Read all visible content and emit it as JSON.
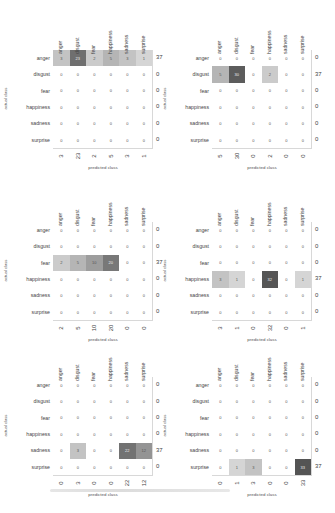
{
  "chart_data": [
    {
      "type": "heatmap",
      "title": "",
      "xlabel": "predicted class",
      "ylabel": "actual class",
      "classes": [
        "anger",
        "disgust",
        "fear",
        "happiness",
        "sadness",
        "surprise"
      ],
      "matrix": [
        [
          3,
          23,
          2,
          5,
          3,
          1
        ],
        [
          0,
          0,
          0,
          0,
          0,
          0
        ],
        [
          0,
          0,
          0,
          0,
          0,
          0
        ],
        [
          0,
          0,
          0,
          0,
          0,
          0
        ],
        [
          0,
          0,
          0,
          0,
          0,
          0
        ],
        [
          0,
          0,
          0,
          0,
          0,
          0
        ]
      ],
      "row_sums": [
        37,
        0,
        0,
        0,
        0,
        0
      ],
      "col_sums": [
        3,
        23,
        2,
        5,
        3,
        1
      ]
    },
    {
      "type": "heatmap",
      "title": "",
      "xlabel": "predicted class",
      "ylabel": "actual class",
      "classes": [
        "anger",
        "disgust",
        "fear",
        "happiness",
        "sadness",
        "surprise"
      ],
      "matrix": [
        [
          0,
          0,
          0,
          0,
          0,
          0
        ],
        [
          5,
          30,
          0,
          2,
          0,
          0
        ],
        [
          0,
          0,
          0,
          0,
          0,
          0
        ],
        [
          0,
          0,
          0,
          0,
          0,
          0
        ],
        [
          0,
          0,
          0,
          0,
          0,
          0
        ],
        [
          0,
          0,
          0,
          0,
          0,
          0
        ]
      ],
      "row_sums": [
        0,
        37,
        0,
        0,
        0,
        0
      ],
      "col_sums": [
        5,
        30,
        0,
        2,
        0,
        0
      ]
    },
    {
      "type": "heatmap",
      "title": "",
      "xlabel": "predicted class",
      "ylabel": "actual class",
      "classes": [
        "anger",
        "disgust",
        "fear",
        "happiness",
        "sadness",
        "surprise"
      ],
      "matrix": [
        [
          0,
          0,
          0,
          0,
          0,
          0
        ],
        [
          0,
          0,
          0,
          0,
          0,
          0
        ],
        [
          2,
          5,
          10,
          20,
          0,
          0
        ],
        [
          0,
          0,
          0,
          0,
          0,
          0
        ],
        [
          0,
          0,
          0,
          0,
          0,
          0
        ],
        [
          0,
          0,
          0,
          0,
          0,
          0
        ]
      ],
      "row_sums": [
        0,
        0,
        37,
        0,
        0,
        0
      ],
      "col_sums": [
        2,
        5,
        10,
        20,
        0,
        0
      ]
    },
    {
      "type": "heatmap",
      "title": "",
      "xlabel": "predicted class",
      "ylabel": "actual class",
      "classes": [
        "anger",
        "disgust",
        "fear",
        "happiness",
        "sadness",
        "surprise"
      ],
      "matrix": [
        [
          0,
          0,
          0,
          0,
          0,
          0
        ],
        [
          0,
          0,
          0,
          0,
          0,
          0
        ],
        [
          0,
          0,
          0,
          0,
          0,
          0
        ],
        [
          3,
          1,
          0,
          32,
          0,
          1
        ],
        [
          0,
          0,
          0,
          0,
          0,
          0
        ],
        [
          0,
          0,
          0,
          0,
          0,
          0
        ]
      ],
      "row_sums": [
        0,
        0,
        0,
        37,
        0,
        0
      ],
      "col_sums": [
        3,
        1,
        0,
        32,
        0,
        1
      ]
    },
    {
      "type": "heatmap",
      "title": "",
      "xlabel": "predicted class",
      "ylabel": "actual class",
      "classes": [
        "anger",
        "disgust",
        "fear",
        "happiness",
        "sadness",
        "surprise"
      ],
      "matrix": [
        [
          0,
          0,
          0,
          0,
          0,
          0
        ],
        [
          0,
          0,
          0,
          0,
          0,
          0
        ],
        [
          0,
          0,
          0,
          0,
          0,
          0
        ],
        [
          0,
          0,
          0,
          0,
          0,
          0
        ],
        [
          0,
          3,
          0,
          0,
          22,
          12
        ],
        [
          0,
          0,
          0,
          0,
          0,
          0
        ]
      ],
      "row_sums": [
        0,
        0,
        0,
        0,
        37,
        0
      ],
      "col_sums": [
        0,
        3,
        0,
        0,
        22,
        12
      ]
    },
    {
      "type": "heatmap",
      "title": "",
      "xlabel": "predicted class",
      "ylabel": "actual class",
      "classes": [
        "anger",
        "disgust",
        "fear",
        "happiness",
        "sadness",
        "surprise"
      ],
      "matrix": [
        [
          0,
          0,
          0,
          0,
          0,
          0
        ],
        [
          0,
          0,
          0,
          0,
          0,
          0
        ],
        [
          0,
          0,
          0,
          0,
          0,
          0
        ],
        [
          0,
          0,
          0,
          0,
          0,
          0
        ],
        [
          0,
          0,
          0,
          0,
          0,
          0
        ],
        [
          0,
          1,
          3,
          0,
          0,
          33
        ]
      ],
      "row_sums": [
        0,
        0,
        0,
        0,
        0,
        37
      ],
      "col_sums": [
        0,
        1,
        3,
        0,
        0,
        33
      ]
    }
  ],
  "layout": {
    "positions": [
      {
        "gx": 53,
        "gy": 50
      },
      {
        "gx": 212,
        "gy": 50
      },
      {
        "gx": 53,
        "gy": 222
      },
      {
        "gx": 212,
        "gy": 222
      },
      {
        "gx": 53,
        "gy": 377
      },
      {
        "gx": 212,
        "gy": 377
      }
    ],
    "max_value": 37,
    "color_low": "#ffffff",
    "color_high": "#4a4a4a"
  }
}
